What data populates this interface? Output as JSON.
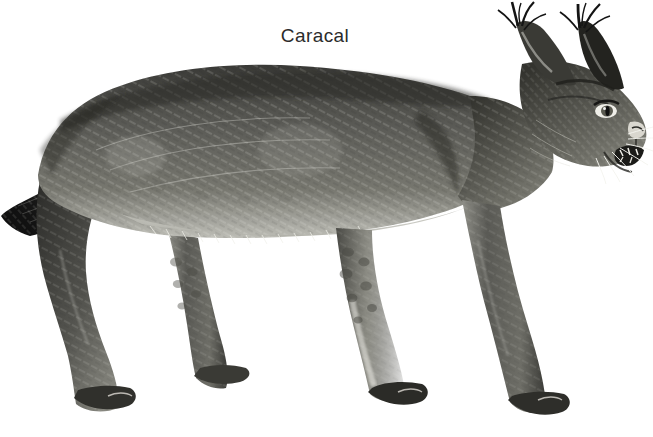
{
  "image": {
    "caption": "Caracal",
    "subject": "caracal",
    "medium": "grayscale pencil / engraving style illustration",
    "view": "full body, left side profile, head turned toward viewer-right, snarling",
    "background_color": "#ffffff",
    "caption_color": "#2b2b2b",
    "rule_color": "#e4e6e8",
    "palette": {
      "fur_dark": "#2e2e2e",
      "fur_mid": "#63635f",
      "fur_light": "#a9a9a4",
      "highlight": "#e8e8e4",
      "tuft_black": "#141414",
      "belly_light": "#d9d9d3",
      "spot": "#4a4a46"
    },
    "features": [
      "two long black tufts on ear tips reaching top edge",
      "open snarling mouth showing teeth",
      "white whiskers fanning right from muzzle",
      "dark facial stripes from eye to muzzle",
      "short ringless dark-tipped tail at left",
      "rosette-like spots on upper forelegs and hind legs",
      "pale fringe of fur along the belly line",
      "all four paws visible, no ground line"
    ],
    "anatomy_points": {
      "ear_tuft_left_top": [
        516,
        2
      ],
      "ear_tuft_right_top": [
        598,
        4
      ],
      "nose": [
        639,
        128
      ],
      "back_highest": [
        250,
        72
      ],
      "tail_tip": [
        2,
        212
      ],
      "hind_paw_near": [
        95,
        408
      ],
      "hind_paw_far": [
        190,
        390
      ],
      "front_paw_near": [
        385,
        400
      ],
      "front_paw_far": [
        520,
        420
      ]
    }
  }
}
